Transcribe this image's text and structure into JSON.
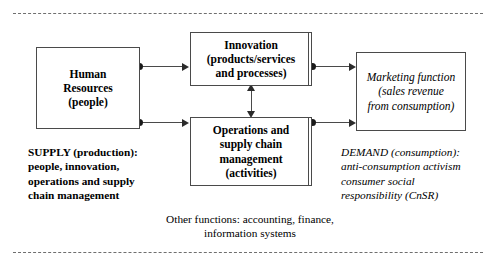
{
  "diagram": {
    "nodes": {
      "human_resources": "Human\nResources\n(people)",
      "innovation": "Innovation\n(products/services\nand processes)",
      "operations": "Operations and\nsupply chain\nmanagement\n(activities)",
      "marketing": "Marketing function\n(sales revenue\nfrom consumption)"
    },
    "annotations": {
      "supply": "SUPPLY (production):\npeople, innovation,\noperations and supply\nchain management",
      "demand": "DEMAND (consumption):\nanti-consumption activism\nconsumer social\nresponsibility (CnSR)",
      "other_functions": "Other functions: accounting, finance,\ninformation systems"
    },
    "colors": {
      "border": "#4a4a4a",
      "connector": "#4a4a4a",
      "dot": "#1a1a1a",
      "frame_dash": "#6f6f6f",
      "background": "#ffffff",
      "text": "#000000"
    }
  }
}
